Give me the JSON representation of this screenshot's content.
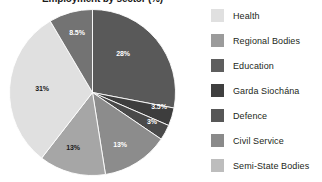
{
  "chart_data": {
    "type": "pie",
    "title": "Employment by sector (%)",
    "xlabel": "",
    "ylabel": "",
    "legend_position": "right",
    "grid": false,
    "start_angle_deg": 0,
    "direction": "clockwise",
    "categories": [
      "Education",
      "Garda Siochána",
      "Defence",
      "Civil Service",
      "Semi-State Bodies",
      "Health",
      "Regional Bodies"
    ],
    "values": [
      28,
      3.5,
      3,
      13,
      13,
      31,
      8.5
    ],
    "labels": [
      "28%",
      "3.5%",
      "3%",
      "13%",
      "13%",
      "31%",
      "8.5%"
    ],
    "colors": [
      "#595959",
      "#3d3d3d",
      "#4a4a4a",
      "#8c8c8c",
      "#a6a6a6",
      "#e0e0e0",
      "#737373"
    ],
    "slices": [
      {
        "name": "Education",
        "value": 28,
        "label": "28%",
        "color": "#595959",
        "label_color": "light",
        "label_x": 123,
        "label_y": 53
      },
      {
        "name": "Garda Siochána",
        "value": 3.5,
        "label": "3.5%",
        "color": "#3d3d3d",
        "label_color": "light",
        "label_x": 159,
        "label_y": 106
      },
      {
        "name": "Defence",
        "value": 3,
        "label": "3%",
        "color": "#4a4a4a",
        "label_color": "light",
        "label_x": 152,
        "label_y": 121
      },
      {
        "name": "Civil Service",
        "value": 13,
        "label": "13%",
        "color": "#8c8c8c",
        "label_color": "light",
        "label_x": 120,
        "label_y": 144
      },
      {
        "name": "Semi-State Bodies",
        "value": 13,
        "label": "13%",
        "color": "#a6a6a6",
        "label_color": "dark",
        "label_x": 73,
        "label_y": 147
      },
      {
        "name": "Health",
        "value": 31,
        "label": "31%",
        "color": "#e0e0e0",
        "label_color": "dark",
        "label_x": 42,
        "label_y": 88
      },
      {
        "name": "Regional Bodies",
        "value": 8.5,
        "label": "8.5%",
        "color": "#737373",
        "label_color": "light",
        "label_x": 77,
        "label_y": 32
      }
    ]
  },
  "legend": {
    "items": [
      {
        "label": "Health",
        "color": "#e0e0e0"
      },
      {
        "label": "Regional Bodies",
        "color": "#9b9b9b"
      },
      {
        "label": "Education",
        "color": "#5e5e5e"
      },
      {
        "label": "Garda Siochána",
        "color": "#3f3f3f"
      },
      {
        "label": "Defence",
        "color": "#575757"
      },
      {
        "label": "Civil Service",
        "color": "#8a8a8a"
      },
      {
        "label": "Semi-State Bodies",
        "color": "#bdbdbd"
      }
    ]
  }
}
